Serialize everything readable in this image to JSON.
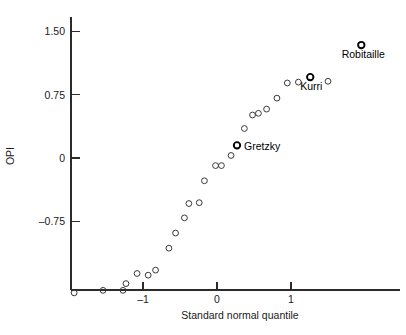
{
  "chart_data": {
    "type": "scatter",
    "title": "",
    "xlabel": "Standard normal quantile",
    "ylabel": "OPI",
    "xlim": [
      -2.05,
      2.25
    ],
    "ylim": [
      -1.7,
      1.92
    ],
    "xticks": [
      -1,
      0,
      1
    ],
    "xtick_labels": [
      "–1",
      "0",
      "1"
    ],
    "yticks": [
      1.5,
      0.75,
      0,
      -0.75
    ],
    "ytick_labels": [
      "1.50",
      "0.75",
      "0",
      "–0.75"
    ],
    "grid": false,
    "legend": "none",
    "points": [
      {
        "x": -1.93,
        "y": -1.6,
        "label": "",
        "highlight": false
      },
      {
        "x": -1.54,
        "y": -1.57,
        "label": "",
        "highlight": false
      },
      {
        "x": -1.27,
        "y": -1.57,
        "label": "",
        "highlight": false
      },
      {
        "x": -1.23,
        "y": -1.49,
        "label": "",
        "highlight": false
      },
      {
        "x": -1.08,
        "y": -1.37,
        "label": "",
        "highlight": false
      },
      {
        "x": -0.93,
        "y": -1.39,
        "label": "",
        "highlight": false
      },
      {
        "x": -0.83,
        "y": -1.33,
        "label": "",
        "highlight": false
      },
      {
        "x": -0.65,
        "y": -1.07,
        "label": "",
        "highlight": false
      },
      {
        "x": -0.56,
        "y": -0.89,
        "label": "",
        "highlight": false
      },
      {
        "x": -0.44,
        "y": -0.71,
        "label": "",
        "highlight": false
      },
      {
        "x": -0.38,
        "y": -0.54,
        "label": "",
        "highlight": false
      },
      {
        "x": -0.24,
        "y": -0.53,
        "label": "",
        "highlight": false
      },
      {
        "x": -0.17,
        "y": -0.27,
        "label": "",
        "highlight": false
      },
      {
        "x": -0.02,
        "y": -0.09,
        "label": "",
        "highlight": false
      },
      {
        "x": 0.06,
        "y": -0.09,
        "label": "",
        "highlight": false
      },
      {
        "x": 0.19,
        "y": 0.03,
        "label": "",
        "highlight": false
      },
      {
        "x": 0.27,
        "y": 0.15,
        "label": "Gretzky",
        "highlight": true
      },
      {
        "x": 0.37,
        "y": 0.35,
        "label": "",
        "highlight": false
      },
      {
        "x": 0.48,
        "y": 0.51,
        "label": "",
        "highlight": false
      },
      {
        "x": 0.56,
        "y": 0.53,
        "label": "",
        "highlight": false
      },
      {
        "x": 0.67,
        "y": 0.58,
        "label": "",
        "highlight": false
      },
      {
        "x": 0.81,
        "y": 0.71,
        "label": "",
        "highlight": false
      },
      {
        "x": 0.95,
        "y": 0.89,
        "label": "",
        "highlight": false
      },
      {
        "x": 1.1,
        "y": 0.9,
        "label": "",
        "highlight": false
      },
      {
        "x": 1.26,
        "y": 0.96,
        "label": "Kurri",
        "highlight": true
      },
      {
        "x": 1.5,
        "y": 0.91,
        "label": "",
        "highlight": false
      },
      {
        "x": 1.95,
        "y": 1.34,
        "label": "Robitaille",
        "highlight": true
      }
    ]
  },
  "axes": {
    "x_title": "Standard normal quantile",
    "y_title": "OPI"
  },
  "annotations": [
    {
      "name": "gretzky",
      "text": "Gretzky"
    },
    {
      "name": "kurri",
      "text": "Kurri"
    },
    {
      "name": "robitaille",
      "text": "Robitaille"
    }
  ]
}
